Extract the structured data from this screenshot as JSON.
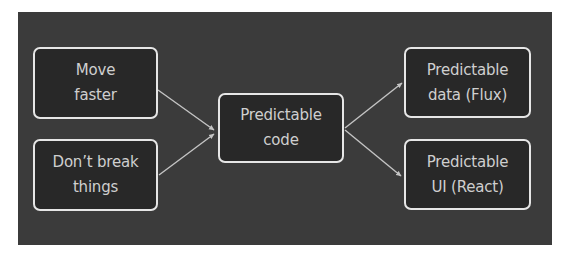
{
  "diagram": {
    "type": "flow",
    "colors": {
      "page_background": "#ffffff",
      "panel_background": "#3b3b3b",
      "node_fill": "#282828",
      "node_border": "#e6e6e6",
      "node_text": "#cfcfcf",
      "edge": "#c4c4c4"
    },
    "nodes": [
      {
        "id": "move-faster",
        "lines": [
          "Move",
          "faster"
        ]
      },
      {
        "id": "dont-break-things",
        "lines": [
          "Don’t break",
          "things"
        ]
      },
      {
        "id": "predictable-code",
        "lines": [
          "Predictable",
          "code"
        ]
      },
      {
        "id": "predictable-data",
        "lines": [
          "Predictable",
          "data (Flux)"
        ]
      },
      {
        "id": "predictable-ui",
        "lines": [
          "Predictable",
          "UI (React)"
        ]
      }
    ],
    "edges": [
      {
        "from": "move-faster",
        "to": "predictable-code"
      },
      {
        "from": "dont-break-things",
        "to": "predictable-code"
      },
      {
        "from": "predictable-code",
        "to": "predictable-data"
      },
      {
        "from": "predictable-code",
        "to": "predictable-ui"
      }
    ]
  }
}
